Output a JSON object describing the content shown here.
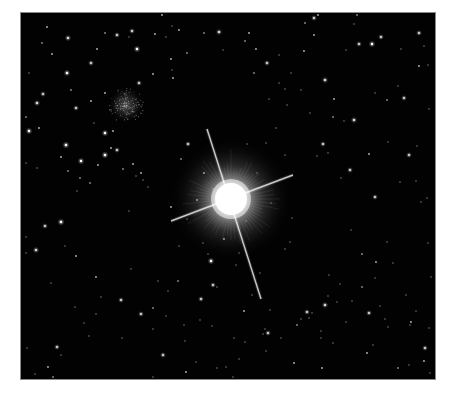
{
  "image": {
    "kind": "astronomical photograph",
    "background_color": "#ffffff",
    "sky_color": "#020202",
    "frame": {
      "x": 20,
      "y": 12,
      "width": 416,
      "height": 368
    }
  },
  "bright_star": {
    "cx": 210,
    "cy": 186,
    "core_radius": 16,
    "halo_radius": 62,
    "spikes": [
      {
        "x1": 186,
        "y1": 116,
        "x2": 240,
        "y2": 286
      },
      {
        "x1": 150,
        "y1": 208,
        "x2": 272,
        "y2": 162
      }
    ]
  },
  "cluster": {
    "cx": 105,
    "cy": 92,
    "r": 18
  },
  "stars": [
    [
      26,
      14,
      1.2
    ],
    [
      47,
      25,
      1.4
    ],
    [
      84,
      20,
      1.1
    ],
    [
      96,
      22,
      1.3
    ],
    [
      108,
      24,
      1.0
    ],
    [
      116,
      36,
      1.5
    ],
    [
      70,
      50,
      1.3
    ],
    [
      76,
      36,
      1.2
    ],
    [
      31,
      41,
      1.2
    ],
    [
      21,
      30,
      1.1
    ],
    [
      46,
      60,
      1.5
    ],
    [
      16,
      90,
      1.4
    ],
    [
      22,
      81,
      1.3
    ],
    [
      50,
      77,
      1.1
    ],
    [
      70,
      88,
      1.2
    ],
    [
      73,
      110,
      1.0
    ],
    [
      84,
      80,
      1.2
    ],
    [
      118,
      70,
      1.3
    ],
    [
      132,
      61,
      1.2
    ],
    [
      151,
      57,
      1.0
    ],
    [
      150,
      46,
      1.2
    ],
    [
      111,
      18,
      1.3
    ],
    [
      134,
      21,
      1.2
    ],
    [
      141,
      2,
      1.2
    ],
    [
      145,
      24,
      1.0
    ],
    [
      152,
      65,
      1.2
    ],
    [
      5,
      104,
      1.1
    ],
    [
      8,
      118,
      1.5
    ],
    [
      18,
      115,
      1.2
    ],
    [
      55,
      95,
      1.3
    ],
    [
      151,
      13,
      1.0
    ],
    [
      158,
      17,
      1.2
    ],
    [
      166,
      40,
      1.1
    ],
    [
      183,
      20,
      1.1
    ],
    [
      198,
      19,
      1.4
    ],
    [
      224,
      28,
      1.1
    ],
    [
      228,
      20,
      1.2
    ],
    [
      235,
      36,
      1.2
    ],
    [
      202,
      37,
      1.0
    ],
    [
      233,
      60,
      1.1
    ],
    [
      246,
      50,
      1.3
    ],
    [
      258,
      42,
      1.0
    ],
    [
      248,
      86,
      1.0
    ],
    [
      264,
      76,
      1.0
    ],
    [
      283,
      38,
      1.2
    ],
    [
      284,
      10,
      1.1
    ],
    [
      293,
      5,
      1.3
    ],
    [
      297,
      2,
      1.2
    ],
    [
      293,
      22,
      1.2
    ],
    [
      325,
      37,
      1.0
    ],
    [
      333,
      11,
      1.0
    ],
    [
      336,
      2,
      1.1
    ],
    [
      338,
      31,
      1.3
    ],
    [
      351,
      31,
      1.5
    ],
    [
      360,
      24,
      1.3
    ],
    [
      380,
      36,
      1.0
    ],
    [
      398,
      20,
      1.3
    ],
    [
      403,
      33,
      1.0
    ],
    [
      398,
      53,
      1.2
    ],
    [
      407,
      52,
      1.0
    ],
    [
      383,
      85,
      1.3
    ],
    [
      366,
      87,
      1.1
    ],
    [
      354,
      80,
      1.0
    ],
    [
      304,
      67,
      1.4
    ],
    [
      313,
      86,
      1.2
    ],
    [
      333,
      107,
      1.4
    ],
    [
      377,
      73,
      1.0
    ],
    [
      270,
      60,
      1.0
    ],
    [
      280,
      77,
      1.0
    ],
    [
      289,
      100,
      1.0
    ],
    [
      258,
      70,
      1.0
    ],
    [
      266,
      92,
      1.0
    ],
    [
      40,
      144,
      1.2
    ],
    [
      45,
      132,
      1.6
    ],
    [
      60,
      148,
      1.5
    ],
    [
      77,
      152,
      1.2
    ],
    [
      84,
      142,
      1.6
    ],
    [
      90,
      135,
      1.2
    ],
    [
      96,
      137,
      1.3
    ],
    [
      84,
      120,
      1.5
    ],
    [
      92,
      118,
      1.2
    ],
    [
      56,
      178,
      1.0
    ],
    [
      16,
      155,
      1.0
    ],
    [
      69,
      170,
      1.1
    ],
    [
      40,
      209,
      1.6
    ],
    [
      59,
      165,
      1.1
    ],
    [
      47,
      158,
      1.1
    ],
    [
      24,
      213,
      1.3
    ],
    [
      15,
      237,
      1.4
    ],
    [
      112,
      151,
      1.2
    ],
    [
      102,
      156,
      1.1
    ],
    [
      115,
      163,
      1.0
    ],
    [
      122,
      167,
      1.0
    ],
    [
      108,
      198,
      1.0
    ],
    [
      160,
      146,
      1.1
    ],
    [
      167,
      131,
      1.3
    ],
    [
      127,
      174,
      1.0
    ],
    [
      120,
      160,
      1.2
    ],
    [
      55,
      243,
      1.2
    ],
    [
      354,
      184,
      1.3
    ],
    [
      400,
      189,
      1.0
    ],
    [
      379,
      169,
      1.0
    ],
    [
      366,
      229,
      1.0
    ],
    [
      355,
      249,
      1.2
    ],
    [
      341,
      241,
      1.1
    ],
    [
      330,
      217,
      1.0
    ],
    [
      320,
      165,
      1.0
    ],
    [
      307,
      140,
      1.0
    ],
    [
      302,
      131,
      1.3
    ],
    [
      329,
      157,
      1.3
    ],
    [
      348,
      141,
      1.2
    ],
    [
      367,
      129,
      1.0
    ],
    [
      296,
      143,
      1.0
    ],
    [
      323,
      108,
      1.0
    ],
    [
      312,
      104,
      1.1
    ],
    [
      396,
      133,
      1.0
    ],
    [
      388,
      142,
      1.3
    ],
    [
      319,
      271,
      1.0
    ],
    [
      316,
      289,
      1.0
    ],
    [
      307,
      283,
      1.0
    ],
    [
      395,
      168,
      1.0
    ],
    [
      308,
      262,
      1.0
    ],
    [
      341,
      274,
      1.1
    ],
    [
      346,
      340,
      1.2
    ],
    [
      352,
      332,
      1.0
    ],
    [
      377,
      355,
      1.1
    ],
    [
      388,
      352,
      1.0
    ],
    [
      403,
      348,
      1.2
    ],
    [
      404,
      335,
      1.3
    ],
    [
      390,
      309,
      1.2
    ],
    [
      389,
      312,
      1.0
    ],
    [
      367,
      314,
      1.0
    ],
    [
      348,
      300,
      1.3
    ],
    [
      364,
      306,
      1.0
    ],
    [
      325,
      309,
      1.0
    ],
    [
      354,
      265,
      1.0
    ],
    [
      359,
      293,
      1.0
    ],
    [
      331,
      288,
      1.0
    ],
    [
      300,
      325,
      1.0
    ],
    [
      292,
      367,
      1.1
    ],
    [
      301,
      355,
      1.2
    ],
    [
      304,
      292,
      1.4
    ],
    [
      288,
      305,
      1.0
    ],
    [
      291,
      300,
      1.0
    ],
    [
      273,
      350,
      1.2
    ],
    [
      260,
      325,
      1.0
    ],
    [
      247,
      320,
      1.3
    ],
    [
      245,
      338,
      1.0
    ],
    [
      300,
      318,
      1.0
    ],
    [
      312,
      330,
      1.0
    ],
    [
      276,
      312,
      1.1
    ],
    [
      280,
      306,
      1.0
    ],
    [
      286,
      299,
      1.3
    ],
    [
      231,
      282,
      1.0
    ],
    [
      239,
      260,
      1.0
    ],
    [
      242,
      321,
      1.0
    ],
    [
      244,
      316,
      1.0
    ],
    [
      249,
      297,
      1.0
    ],
    [
      223,
      298,
      1.2
    ],
    [
      224,
      329,
      1.0
    ],
    [
      218,
      346,
      1.0
    ],
    [
      192,
      272,
      1.3
    ],
    [
      180,
      286,
      1.3
    ],
    [
      213,
      325,
      1.0
    ],
    [
      191,
      313,
      1.0
    ],
    [
      196,
      355,
      1.0
    ],
    [
      165,
      359,
      1.2
    ],
    [
      175,
      349,
      1.0
    ],
    [
      164,
      328,
      1.0
    ],
    [
      157,
      268,
      1.1
    ],
    [
      163,
      312,
      1.0
    ],
    [
      142,
      342,
      1.3
    ],
    [
      132,
      316,
      1.0
    ],
    [
      137,
      268,
      1.0
    ],
    [
      110,
      256,
      1.0
    ],
    [
      120,
      301,
      1.3
    ],
    [
      132,
      295,
      1.1
    ],
    [
      145,
      303,
      1.0
    ],
    [
      100,
      287,
      1.3
    ],
    [
      101,
      325,
      1.0
    ],
    [
      80,
      284,
      1.0
    ],
    [
      54,
      294,
      1.0
    ],
    [
      36,
      334,
      1.3
    ],
    [
      27,
      354,
      1.2
    ],
    [
      32,
      364,
      1.1
    ],
    [
      14,
      361,
      1.0
    ],
    [
      40,
      342,
      1.0
    ],
    [
      68,
      323,
      1.0
    ],
    [
      63,
      310,
      1.0
    ],
    [
      75,
      264,
      1.2
    ],
    [
      75,
      301,
      1.0
    ],
    [
      44,
      233,
      1.0
    ],
    [
      30,
      270,
      1.0
    ],
    [
      6,
      335,
      1.0
    ],
    [
      86,
      367,
      1.0
    ],
    [
      132,
      364,
      1.0
    ],
    [
      190,
      248,
      1.5
    ],
    [
      187,
      241,
      1.0
    ],
    [
      203,
      226,
      1.2
    ],
    [
      215,
      252,
      1.0
    ],
    [
      182,
      230,
      1.0
    ],
    [
      218,
      240,
      1.0
    ],
    [
      196,
      274,
      1.0
    ],
    [
      225,
      208,
      1.0
    ],
    [
      166,
      206,
      1.0
    ],
    [
      176,
      187,
      1.2
    ],
    [
      183,
      160,
      1.2
    ],
    [
      192,
      176,
      1.0
    ],
    [
      236,
      160,
      1.0
    ],
    [
      250,
      190,
      1.0
    ],
    [
      264,
      236,
      1.0
    ],
    [
      271,
      205,
      1.0
    ],
    [
      269,
      229,
      1.0
    ],
    [
      226,
      131,
      1.0
    ],
    [
      255,
      115,
      1.0
    ],
    [
      264,
      142,
      1.0
    ],
    [
      245,
      130,
      1.0
    ],
    [
      150,
      194,
      1.2
    ],
    [
      158,
      233,
      1.0
    ],
    [
      147,
      278,
      1.0
    ],
    [
      179,
      307,
      1.0
    ],
    [
      205,
      354,
      1.0
    ],
    [
      212,
      364,
      1.0
    ],
    [
      5,
      224,
      1.0
    ],
    [
      5,
      240,
      1.0
    ],
    [
      8,
      60,
      1.0
    ],
    [
      5,
      150,
      1.0
    ],
    [
      408,
      96,
      1.0
    ],
    [
      407,
      230,
      1.0
    ],
    [
      410,
      264,
      1.0
    ],
    [
      408,
      315,
      1.0
    ],
    [
      409,
      360,
      1.0
    ],
    [
      406,
      185,
      1.0
    ],
    [
      395,
      298,
      1.0
    ],
    [
      385,
      282,
      1.0
    ],
    [
      372,
      250,
      1.0
    ]
  ]
}
